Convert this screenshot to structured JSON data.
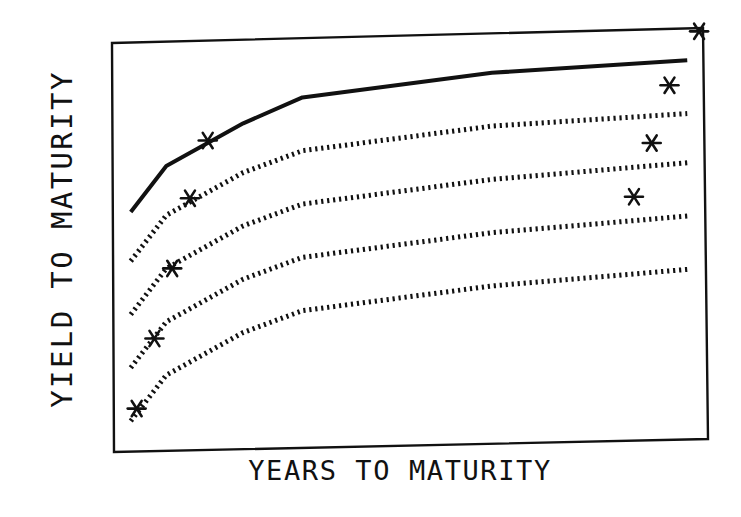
{
  "chart_data": {
    "type": "line",
    "title": "",
    "xlabel": "YEARS TO MATURITY",
    "ylabel": "YIELD TO MATURITY",
    "grid": false,
    "legend": null,
    "axis_ticks": "none",
    "x_range_relative": [
      0,
      1
    ],
    "y_range_relative": [
      0,
      1
    ],
    "note": "Schematic chart without numeric ticks; values are relative positions (0 = bottom/left of plot frame, 1 = top/right).",
    "x": [
      0.03,
      0.09,
      0.22,
      0.32,
      0.64,
      0.97
    ],
    "series": [
      {
        "name": "curve-1",
        "style": "solid",
        "values": [
          0.57,
          0.68,
          0.78,
          0.84,
          0.89,
          0.91
        ]
      },
      {
        "name": "curve-2",
        "style": "dotted",
        "values": [
          0.45,
          0.56,
          0.66,
          0.71,
          0.76,
          0.78
        ]
      },
      {
        "name": "curve-3",
        "style": "dotted",
        "values": [
          0.32,
          0.43,
          0.53,
          0.58,
          0.63,
          0.66
        ]
      },
      {
        "name": "curve-4",
        "style": "dotted",
        "values": [
          0.19,
          0.3,
          0.4,
          0.45,
          0.5,
          0.53
        ]
      },
      {
        "name": "curve-5",
        "style": "dotted",
        "values": [
          0.06,
          0.17,
          0.27,
          0.32,
          0.37,
          0.4
        ]
      }
    ],
    "markers": {
      "symbol": "asterisk",
      "points": [
        {
          "x": 0.16,
          "y": 0.74
        },
        {
          "x": 0.13,
          "y": 0.6
        },
        {
          "x": 0.1,
          "y": 0.43
        },
        {
          "x": 0.07,
          "y": 0.26
        },
        {
          "x": 0.04,
          "y": 0.09
        },
        {
          "x": 0.99,
          "y": 0.98
        },
        {
          "x": 0.94,
          "y": 0.85
        },
        {
          "x": 0.91,
          "y": 0.71
        },
        {
          "x": 0.88,
          "y": 0.58
        }
      ]
    }
  },
  "colors": {
    "ink": "#111111",
    "background": "#ffffff"
  }
}
